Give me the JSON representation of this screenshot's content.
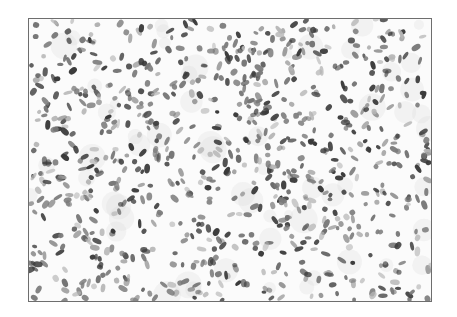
{
  "image": {
    "description": "Grayscale histology micrograph showing densely scattered spindle and oval cell nuclei with whorled arrangement",
    "frame": {
      "x": 28,
      "y": 18,
      "width": 402,
      "height": 282,
      "border_color": "#6e6e6e"
    },
    "colors": {
      "background": "#fbfbfb",
      "nucleus_dark": "#3a3a3a",
      "nucleus_mid": "#7a7a7a",
      "nucleus_light": "#b5b5b5"
    },
    "nuclei": {
      "count": 900,
      "seed": 1337,
      "whorl_center": {
        "x": 210,
        "y": 160
      }
    }
  }
}
